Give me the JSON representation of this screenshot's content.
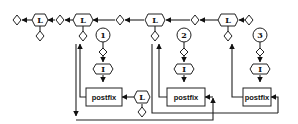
{
  "diagram": {
    "type": "flow-graph",
    "colors": {
      "stroke": "#222222",
      "fill": "#ffffff",
      "background": "#ffffff"
    },
    "top_chain": {
      "l_nodes": [
        {
          "id": "L-a",
          "label": "L"
        },
        {
          "id": "L-b",
          "label": "L"
        },
        {
          "id": "L-c",
          "label": "L"
        },
        {
          "id": "L-d",
          "label": "L"
        }
      ]
    },
    "branches": [
      {
        "number": "1",
        "input_label": "I",
        "box_label": "postfix"
      },
      {
        "number": "2",
        "input_label": "I",
        "box_label": "postfix"
      },
      {
        "number": "3",
        "input_label": "I",
        "box_label": "postfix"
      }
    ],
    "side_node": {
      "label": "L"
    }
  }
}
